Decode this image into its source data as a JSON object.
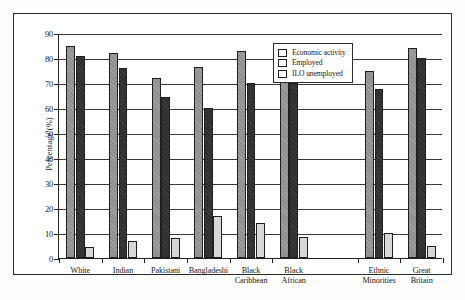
{
  "chart_data": {
    "type": "bar",
    "title": "",
    "xlabel": "",
    "ylabel": "Percentage (%)",
    "ylim": [
      0,
      90
    ],
    "yticks": [
      0,
      10,
      20,
      30,
      40,
      50,
      60,
      70,
      80,
      90
    ],
    "grid": true,
    "legend_position": "top-right",
    "categories": [
      "White",
      "Indian",
      "Pakistani",
      "Bangladeshi",
      "Black\nCaribbean",
      "Black\nAfrican",
      "Ethnic\nMinorities",
      "Great\nBritain"
    ],
    "series": [
      {
        "name": "Economic activity",
        "color": "#8f8f8f",
        "values": [
          85,
          82,
          72,
          76.5,
          83,
          77.5,
          75,
          84
        ]
      },
      {
        "name": "Employed",
        "color": "#2e2e2e",
        "values": [
          81,
          76,
          64.5,
          60,
          70,
          70,
          67.5,
          80
        ]
      },
      {
        "name": "ILO unemployed",
        "color": "#d8d8d6",
        "values": [
          4.5,
          7,
          8,
          17,
          14,
          8.5,
          10,
          5
        ]
      }
    ]
  }
}
